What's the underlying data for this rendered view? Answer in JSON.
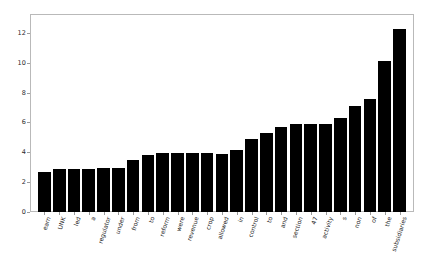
{
  "chart_data": {
    "type": "bar",
    "title": "",
    "subtitle": "",
    "xlabel": "",
    "ylabel": "",
    "grid": false,
    "legend": false,
    "bar_color": "#000000",
    "axis_color": "#b9b9b9",
    "ylim": [
      0,
      13.2
    ],
    "yticks": [
      0,
      2,
      4,
      6,
      8,
      10,
      12
    ],
    "ytick_labels": [
      "0",
      "2",
      "4",
      "6",
      "8",
      "10",
      "12"
    ],
    "categories": [
      "earn",
      "UNK",
      "led",
      "a",
      "regulator",
      "under",
      "from",
      "to",
      "reform",
      "were",
      "revenue",
      "crop",
      "allowed",
      "in",
      "control",
      "to",
      "and",
      "section",
      "47",
      "activity",
      "s",
      "non",
      "of",
      "the",
      "subsidiaries"
    ],
    "values": [
      2.65,
      2.88,
      2.88,
      2.86,
      2.96,
      2.95,
      3.46,
      3.81,
      3.95,
      3.95,
      3.94,
      3.93,
      3.91,
      4.17,
      4.9,
      5.32,
      5.72,
      5.88,
      5.88,
      5.87,
      6.33,
      7.08,
      7.6,
      10.14,
      12.28
    ]
  },
  "accessibility": {
    "chart_description": "Vertical bar chart with 25 black bars of increasing height, rotated word labels along the x-axis."
  }
}
